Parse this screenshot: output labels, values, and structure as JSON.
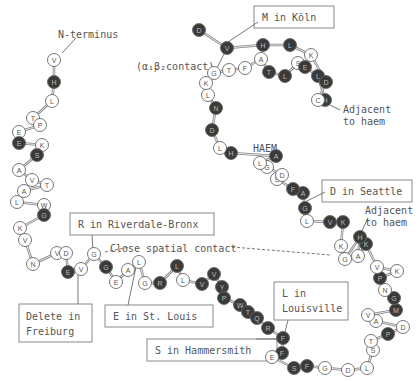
{
  "diagram": {
    "center_label": "HAEM",
    "colors": {
      "stroke": "#666666",
      "dark_fill": "#3a3a3a",
      "light_fill": "#ffffff",
      "text": "#555555",
      "bond": "#888888"
    },
    "labels": {
      "n_terminus": "N-terminus",
      "contact": "(α₁β₂contact)",
      "m_koln": "M in Köln",
      "adjacent_haem_1a": "Adjacent",
      "adjacent_haem_1b": "to haem",
      "d_seattle": "D in Seattle",
      "adjacent_haem_2a": "Adjacent",
      "adjacent_haem_2b": "to haem",
      "r_riverdale": "R in Riverdale-Bronx",
      "close_contact": "Close spatial contact",
      "delete_freiburg_a": "Delete in",
      "delete_freiburg_b": "Freiburg",
      "e_st_louis": "E in St. Louis",
      "l_louisville_a": "L in",
      "l_louisville_b": "Louisville",
      "s_hammersmith": "S in Hammersmith"
    },
    "residues": [
      {
        "aa": "V",
        "dark": false
      },
      {
        "aa": "H",
        "dark": true
      },
      {
        "aa": "L",
        "dark": false
      },
      {
        "aa": "T",
        "dark": false
      },
      {
        "aa": "P",
        "dark": false
      },
      {
        "aa": "E",
        "dark": false
      },
      {
        "aa": "E",
        "dark": true
      },
      {
        "aa": "K",
        "dark": false
      },
      {
        "aa": "S",
        "dark": true
      },
      {
        "aa": "A",
        "dark": false
      },
      {
        "aa": "V",
        "dark": false
      },
      {
        "aa": "T",
        "dark": false
      },
      {
        "aa": "A",
        "dark": false
      },
      {
        "aa": "L",
        "dark": false
      },
      {
        "aa": "W",
        "dark": false
      },
      {
        "aa": "G",
        "dark": true
      },
      {
        "aa": "K",
        "dark": false
      },
      {
        "aa": "V",
        "dark": false
      },
      {
        "aa": "N",
        "dark": false
      },
      {
        "aa": "V",
        "dark": false
      },
      {
        "aa": "D",
        "dark": false
      },
      {
        "aa": "E",
        "dark": true
      },
      {
        "aa": "V",
        "dark": false
      },
      {
        "aa": "G",
        "dark": false
      },
      {
        "aa": "G",
        "dark": true
      },
      {
        "aa": "E",
        "dark": false
      },
      {
        "aa": "A",
        "dark": false
      },
      {
        "aa": "L",
        "dark": false
      },
      {
        "aa": "G",
        "dark": false
      },
      {
        "aa": "R",
        "dark": true
      },
      {
        "aa": "L",
        "dark": true
      },
      {
        "aa": "L",
        "dark": false
      },
      {
        "aa": "V",
        "dark": true
      },
      {
        "aa": "V",
        "dark": true
      },
      {
        "aa": "Y",
        "dark": true
      },
      {
        "aa": "P",
        "dark": true
      },
      {
        "aa": "W",
        "dark": true
      },
      {
        "aa": "T",
        "dark": true
      },
      {
        "aa": "Q",
        "dark": true
      },
      {
        "aa": "R",
        "dark": true
      },
      {
        "aa": "F",
        "dark": true
      },
      {
        "aa": "F",
        "dark": true
      },
      {
        "aa": "E",
        "dark": false
      },
      {
        "aa": "S",
        "dark": true
      },
      {
        "aa": "F",
        "dark": true
      },
      {
        "aa": "G",
        "dark": false
      },
      {
        "aa": "D",
        "dark": false
      },
      {
        "aa": "L",
        "dark": false
      },
      {
        "aa": "S",
        "dark": false
      },
      {
        "aa": "T",
        "dark": false
      },
      {
        "aa": "P",
        "dark": true
      },
      {
        "aa": "D",
        "dark": false
      },
      {
        "aa": "A",
        "dark": false
      },
      {
        "aa": "V",
        "dark": false
      },
      {
        "aa": "M",
        "dark": true
      },
      {
        "aa": "G",
        "dark": true
      },
      {
        "aa": "N",
        "dark": false
      },
      {
        "aa": "P",
        "dark": true
      },
      {
        "aa": "K",
        "dark": false
      },
      {
        "aa": "V",
        "dark": false
      },
      {
        "aa": "K",
        "dark": true
      },
      {
        "aa": "A",
        "dark": false
      },
      {
        "aa": "H",
        "dark": true
      },
      {
        "aa": "G",
        "dark": false
      },
      {
        "aa": "K",
        "dark": false
      },
      {
        "aa": "K",
        "dark": true
      },
      {
        "aa": "V",
        "dark": true
      },
      {
        "aa": "L",
        "dark": false
      },
      {
        "aa": "G",
        "dark": true
      },
      {
        "aa": "A",
        "dark": true
      },
      {
        "aa": "F",
        "dark": true
      },
      {
        "aa": "S",
        "dark": false
      },
      {
        "aa": "D",
        "dark": false
      },
      {
        "aa": "G",
        "dark": false
      },
      {
        "aa": "L",
        "dark": false
      },
      {
        "aa": "A",
        "dark": true
      },
      {
        "aa": "H",
        "dark": true
      },
      {
        "aa": "L",
        "dark": false
      },
      {
        "aa": "D",
        "dark": true
      },
      {
        "aa": "N",
        "dark": true
      },
      {
        "aa": "L",
        "dark": false
      },
      {
        "aa": "K",
        "dark": false
      },
      {
        "aa": "G",
        "dark": false
      },
      {
        "aa": "T",
        "dark": false
      },
      {
        "aa": "F",
        "dark": false
      },
      {
        "aa": "A",
        "dark": false
      },
      {
        "aa": "T",
        "dark": true
      },
      {
        "aa": "L",
        "dark": true
      },
      {
        "aa": "S",
        "dark": false
      },
      {
        "aa": "E",
        "dark": true
      },
      {
        "aa": "L",
        "dark": true
      },
      {
        "aa": "H",
        "dark": true
      },
      {
        "aa": "C",
        "dark": false
      },
      {
        "aa": "D",
        "dark": true
      },
      {
        "aa": "K",
        "dark": false
      },
      {
        "aa": "L",
        "dark": true
      },
      {
        "aa": "H",
        "dark": true
      },
      {
        "aa": "V",
        "dark": true
      },
      {
        "aa": "D",
        "dark": true
      }
    ]
  }
}
